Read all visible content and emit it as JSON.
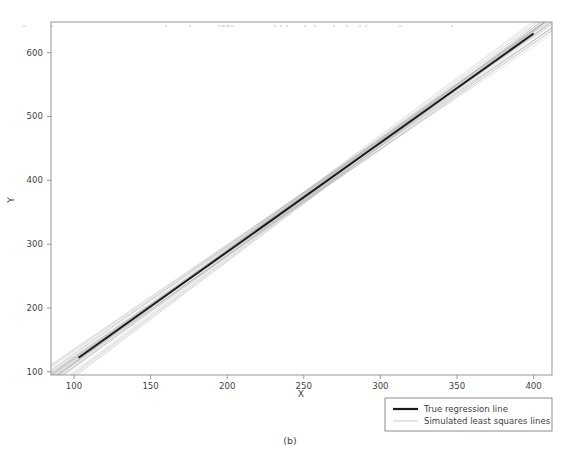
{
  "figure": {
    "caption": "(b)",
    "background": "#ffffff"
  },
  "chart_data": {
    "type": "line",
    "title": "",
    "xlabel": "X",
    "ylabel": "Y",
    "xlim": [
      85,
      412
    ],
    "ylim": [
      95,
      648
    ],
    "xticks": [
      100,
      150,
      200,
      250,
      300,
      350,
      400
    ],
    "yticks": [
      100,
      200,
      300,
      400,
      500,
      600
    ],
    "xticklabels": [
      "100",
      "150",
      "200",
      "250",
      "300",
      "350",
      "400"
    ],
    "yticklabels": [
      "100",
      "200",
      "300",
      "400",
      "500",
      "600"
    ],
    "grid": false,
    "frame": true,
    "legend_position": "lower right outside",
    "series": [
      {
        "name": "True regression line",
        "type": "line",
        "color": "#1a1a1a",
        "linewidth": 1.9,
        "x": [
          103,
          400
        ],
        "y": [
          122,
          630
        ],
        "slope": 1.7104,
        "intercept": -54.17
      },
      {
        "name": "Simulated least squares lines",
        "type": "line-bundle",
        "color": "#b4b4b4",
        "linewidth": 0.45,
        "count": 40,
        "pivot_x": 262,
        "pivot_y": 394,
        "slope_mean": 1.7104,
        "slope_values": [
          1.6161,
          1.7648,
          1.6532,
          1.7905,
          1.688,
          1.7351,
          1.6319,
          1.802,
          1.7032,
          1.6645,
          1.778,
          1.6984,
          1.749,
          1.6438,
          1.7209,
          1.815,
          1.6766,
          1.7615,
          1.6895,
          1.7328,
          1.627,
          1.7935,
          1.7103,
          1.658,
          1.7745,
          1.6712,
          1.7412,
          1.8083,
          1.6959,
          1.7524,
          1.6355,
          1.786,
          1.724,
          1.663,
          1.768,
          1.7046,
          1.649,
          1.7972,
          1.7155,
          1.684
        ],
        "intercept_offsets": [
          -7.2,
          5.4,
          -3.1,
          8.6,
          1.9,
          -5.8,
          6.7,
          -9.3,
          2.4,
          -4.6,
          7.8,
          -1.2,
          4.1,
          -6.9,
          3.3,
          -8.1,
          5.9,
          -2.7,
          8.2,
          -5.1,
          1.4,
          -7.6,
          6.2,
          -3.8,
          4.7,
          -9.0,
          2.1,
          -4.3,
          7.4,
          -1.8,
          5.2,
          -6.4,
          3.9,
          -8.7,
          1.1,
          -5.5,
          6.8,
          -2.3,
          4.4,
          -7.9
        ]
      }
    ],
    "top_markers": {
      "name": "scatter-markers-top",
      "color": "#cfcfcf",
      "marker": "square",
      "size": 1.6,
      "y_row": 645,
      "x_values": [
        24,
        52,
        166,
        190,
        219,
        224,
        229,
        222,
        227,
        232,
        275,
        281,
        287,
        305,
        315,
        334,
        347,
        360,
        366,
        400,
        452
      ]
    }
  },
  "legend": {
    "entries": [
      {
        "label": "True regression line",
        "color": "#1a1a1a",
        "linewidth": 2.2
      },
      {
        "label": "Simulated least squares lines",
        "color": "#c2c2c2",
        "linewidth": 0.8
      }
    ],
    "border_color": "#6f6f6f"
  }
}
